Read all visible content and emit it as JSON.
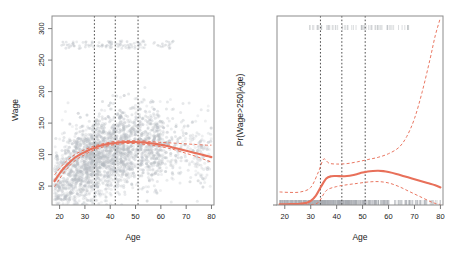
{
  "figure": {
    "title": "",
    "panel_count": 2,
    "accent_color": "#e8705a",
    "point_color": "#b7bcc2",
    "knot_line_color": "#3a3a3a",
    "frame_color": "#8c8c8c",
    "rug_color": "#a8adb3"
  },
  "chart_data": [
    {
      "type": "scatter",
      "panel": "left",
      "title": "",
      "xlabel": "Age",
      "ylabel": "Wage",
      "xlim": [
        17,
        81
      ],
      "ylim": [
        20,
        320
      ],
      "xticks": [
        20,
        30,
        40,
        50,
        60,
        70,
        80
      ],
      "yticks": [
        50,
        100,
        150,
        200,
        250,
        300
      ],
      "grid": false,
      "legend": "none",
      "knots": [
        33.75,
        42.0,
        51.0
      ],
      "fit": {
        "name": "Degree-4 polynomial fit",
        "x": [
          18,
          20,
          22,
          24,
          26,
          28,
          30,
          32,
          34,
          36,
          38,
          40,
          42,
          44,
          46,
          48,
          50,
          52,
          54,
          56,
          58,
          60,
          62,
          64,
          66,
          68,
          70,
          72,
          74,
          76,
          78,
          80
        ],
        "y": [
          58,
          70,
          80,
          88,
          95,
          100,
          104,
          108,
          111,
          114,
          116,
          117.5,
          118.5,
          119.5,
          120,
          120,
          120,
          119.5,
          119,
          118,
          117,
          115.5,
          114,
          112,
          110,
          108,
          106,
          104,
          102,
          100,
          98,
          96
        ]
      },
      "confidence_upper": {
        "name": "Upper 95% band",
        "x": [
          18,
          22,
          26,
          30,
          34,
          38,
          42,
          46,
          50,
          54,
          58,
          62,
          66,
          70,
          74,
          78,
          80
        ],
        "y": [
          68,
          87,
          100,
          108,
          114,
          118,
          121,
          122,
          122,
          121.5,
          120,
          119,
          118,
          117,
          116,
          115,
          115
        ]
      },
      "confidence_lower": {
        "name": "Lower 95% band",
        "x": [
          18,
          22,
          26,
          30,
          34,
          38,
          42,
          46,
          50,
          54,
          58,
          62,
          66,
          70,
          74,
          78,
          80
        ],
        "y": [
          49,
          73,
          90,
          100,
          108,
          113,
          116,
          117.5,
          117.5,
          116,
          114,
          111,
          107,
          102,
          97,
          91,
          88
        ]
      },
      "points_note": "approximately 3000 grey semi-transparent observations, plus a separate high-wage cluster near Wage = 270-280"
    },
    {
      "type": "line",
      "panel": "right",
      "title": "",
      "xlabel": "Age",
      "ylabel": "Pr(Wage>250|Age)",
      "xlim": [
        17,
        81
      ],
      "ylim": [
        0.0,
        0.21
      ],
      "xticks": [
        20,
        30,
        40,
        50,
        60,
        70,
        80
      ],
      "yticks": [
        0.0,
        0.05,
        0.1,
        0.15,
        0.2
      ],
      "ytick_labels": [
        "0.00",
        "0.05",
        "0.10",
        "0.15",
        "0.20"
      ],
      "grid": false,
      "legend": "none",
      "knots": [
        33.75,
        42.0,
        51.0
      ],
      "fit": {
        "name": "Logistic degree-4 polynomial fit",
        "x": [
          18,
          21,
          24,
          26,
          28,
          30,
          32,
          34,
          36,
          38,
          40,
          42,
          44,
          46,
          48,
          50,
          52,
          54,
          56,
          58,
          60,
          63,
          66,
          69,
          72,
          75,
          78,
          80
        ],
        "y": [
          0.0008,
          0.0009,
          0.0011,
          0.0014,
          0.0022,
          0.0045,
          0.0105,
          0.0205,
          0.0295,
          0.032,
          0.0322,
          0.032,
          0.0322,
          0.033,
          0.0345,
          0.036,
          0.0372,
          0.0378,
          0.038,
          0.0376,
          0.0366,
          0.0345,
          0.032,
          0.0295,
          0.027,
          0.0245,
          0.022,
          0.0195
        ]
      },
      "confidence_upper": {
        "name": "Upper 95% band",
        "x": [
          18,
          22,
          26,
          30,
          33,
          35,
          37,
          40,
          44,
          48,
          52,
          56,
          60,
          64,
          67,
          70,
          73,
          76,
          78,
          80
        ],
        "y": [
          0.0145,
          0.014,
          0.0145,
          0.0195,
          0.037,
          0.051,
          0.0465,
          0.0455,
          0.046,
          0.048,
          0.0505,
          0.053,
          0.057,
          0.064,
          0.076,
          0.096,
          0.126,
          0.162,
          0.188,
          0.208
        ]
      },
      "confidence_lower": {
        "name": "Lower 95% band",
        "x": [
          18,
          22,
          26,
          30,
          33,
          36,
          40,
          44,
          48,
          52,
          56,
          60,
          64,
          68,
          72,
          76,
          78,
          80
        ],
        "y": [
          0.0002,
          0.0002,
          0.0002,
          0.0004,
          0.003,
          0.016,
          0.0205,
          0.0225,
          0.024,
          0.0255,
          0.026,
          0.0245,
          0.0205,
          0.015,
          0.0095,
          0.004,
          0.0018,
          0.0005
        ]
      },
      "rug_top_note": "sparse grey rug marks at Pr = 0.20 for observations with Wage > 250",
      "rug_bottom_note": "dense grey rug marks at Pr = 0.00 for observations with Wage <= 250"
    }
  ],
  "left_panel": {
    "xlabel": "Age",
    "ylabel": "Wage",
    "xticks": [
      "20",
      "30",
      "40",
      "50",
      "60",
      "70",
      "80"
    ],
    "yticks": [
      "50",
      "100",
      "150",
      "200",
      "250",
      "300"
    ]
  },
  "right_panel": {
    "xlabel": "Age",
    "ylabel": "Pr(Wage>250|Age)",
    "xticks": [
      "20",
      "30",
      "40",
      "50",
      "60",
      "70",
      "80"
    ],
    "yticks": [
      "0.00",
      "0.05",
      "0.10",
      "0.15",
      "0.20"
    ]
  }
}
